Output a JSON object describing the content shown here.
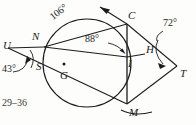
{
  "figure": {
    "type": "circle-geometry-diagram",
    "stroke_color": "#1c1c1c",
    "background_color": "#fdfdfc",
    "caption": "29–36",
    "points": {
      "U": {
        "label": "U",
        "x": 6,
        "y": 44,
        "role": "external-vertex-left"
      },
      "N": {
        "label": "N",
        "x": 34,
        "y": 36,
        "role": "on-circle"
      },
      "S": {
        "label": "S",
        "x": 38,
        "y": 55,
        "role": "on-circle"
      },
      "C": {
        "label": "C",
        "x": 128,
        "y": 14,
        "role": "on-circle"
      },
      "G": {
        "label": "G",
        "x": 62,
        "y": 70,
        "role": "center"
      },
      "I": {
        "label": "I",
        "x": 128,
        "y": 58,
        "role": "interior-intersection"
      },
      "H": {
        "label": "H",
        "x": 146,
        "y": 46,
        "role": "on-circle"
      },
      "T": {
        "label": "T",
        "x": 181,
        "y": 70,
        "role": "external-vertex-right"
      },
      "M": {
        "label": "M",
        "x": 128,
        "y": 105,
        "role": "on-circle"
      }
    },
    "angles": [
      {
        "name": "arc-NC-measure",
        "value": "106°",
        "x": 37,
        "y": 22
      },
      {
        "name": "angle-at-I",
        "value": "88°",
        "x": 85,
        "y": 38
      },
      {
        "name": "angle-at-U",
        "value": "43°",
        "x": 2,
        "y": 66
      },
      {
        "name": "angle-at-T",
        "value": "72°",
        "x": 163,
        "y": 18
      }
    ],
    "circle": {
      "cx": 87,
      "cy": 63,
      "r": 44
    }
  }
}
